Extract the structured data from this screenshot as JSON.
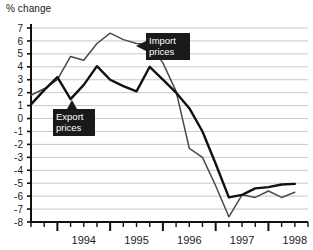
{
  "chart_data": {
    "type": "line",
    "title": "",
    "ylabel": "% change",
    "xlabel": "",
    "ylim": [
      -8,
      7
    ],
    "yticks": [
      7,
      6,
      5,
      4,
      3,
      2,
      1,
      0,
      -1,
      -2,
      -3,
      -4,
      -5,
      -6,
      -7,
      -8
    ],
    "ytick_labels": [
      "7",
      "6",
      "5",
      "4",
      "3",
      "2",
      "1",
      "0",
      "-1",
      "-2",
      "-3",
      "-4",
      "-5",
      "-6",
      "-7",
      "-8"
    ],
    "xlim": [
      1993.5,
      1998.75
    ],
    "xtick_labels": [
      "1994",
      "1995",
      "1996",
      "1997",
      "1998"
    ],
    "xtick_values": [
      1994,
      1995,
      1996,
      1997,
      1998
    ],
    "minor_tick_interval": 0.25,
    "grid": true,
    "legend_position": "inline-annotations",
    "x": [
      1993.5,
      1993.75,
      1994.0,
      1994.25,
      1994.5,
      1994.75,
      1995.0,
      1995.25,
      1995.5,
      1995.75,
      1996.0,
      1996.25,
      1996.5,
      1996.75,
      1997.0,
      1997.25,
      1997.5,
      1997.75,
      1998.0,
      1998.25,
      1998.5
    ],
    "series": [
      {
        "name": "Import prices",
        "color": "#4a4a4a",
        "values": [
          1.8,
          2.3,
          3.0,
          4.8,
          4.5,
          5.8,
          6.6,
          6.1,
          5.8,
          5.75,
          4.3,
          2.1,
          -2.3,
          -3.0,
          -5.2,
          -7.6,
          -5.9,
          -6.1,
          -5.6,
          -6.1,
          -5.7
        ]
      },
      {
        "name": "Export prices",
        "color": "#111111",
        "values": [
          1.1,
          2.2,
          3.2,
          1.5,
          2.6,
          4.05,
          3.0,
          2.5,
          2.1,
          4.0,
          3.0,
          2.0,
          0.8,
          -1.0,
          -3.5,
          -6.1,
          -5.9,
          -5.4,
          -5.3,
          -5.1,
          -5.05
        ]
      }
    ],
    "annotations": [
      {
        "id": "import-callout",
        "label_line1": "Import",
        "label_line2": "prices",
        "arrow_direction": "left"
      },
      {
        "id": "export-callout",
        "label_line1": "Export",
        "label_line2": "prices",
        "arrow_direction": "up"
      }
    ]
  },
  "colors": {
    "import_line": "#4a4a4a",
    "export_line": "#111111",
    "grid": "#c9c9c9",
    "axis": "#111111",
    "callout_bg": "#1a1a1a",
    "callout_text": "#ffffff",
    "background": "#ffffff"
  }
}
